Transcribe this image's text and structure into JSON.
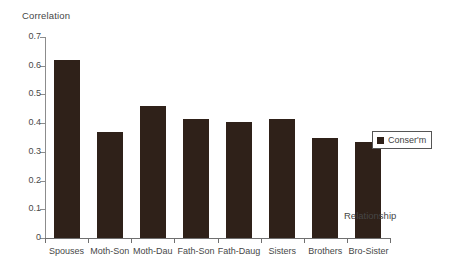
{
  "chart_data": {
    "type": "bar",
    "title": "",
    "xlabel": "Relationship",
    "ylabel": "Correlation",
    "categories": [
      "Spouses",
      "Moth-Son",
      "Moth-Dau",
      "Fath-Son",
      "Fath-Daug",
      "Sisters",
      "Brothers",
      "Bro-Sister"
    ],
    "values": [
      0.62,
      0.37,
      0.46,
      0.415,
      0.405,
      0.415,
      0.35,
      0.335
    ],
    "series": [
      {
        "name": "Conser'm",
        "values": [
          0.62,
          0.37,
          0.46,
          0.415,
          0.405,
          0.415,
          0.35,
          0.335
        ]
      }
    ],
    "ylim": [
      0,
      0.7
    ],
    "ytick_labels": [
      "0",
      "0.1",
      "0.2",
      "0.3",
      "0.4",
      "0.5",
      "0.6",
      "0.7"
    ],
    "ytick_values": [
      0,
      0.1,
      0.2,
      0.3,
      0.4,
      0.5,
      0.6,
      0.7
    ],
    "grid": false,
    "legend_position": "right",
    "legend": [
      "Conser'm"
    ],
    "bar_color": "#2f2119",
    "axis_color": "#6f6f6f",
    "background": "#ffffff"
  },
  "legend": {
    "label": "Conser'm"
  },
  "axis": {
    "y_title": "Correlation",
    "x_title": "Relationship"
  }
}
